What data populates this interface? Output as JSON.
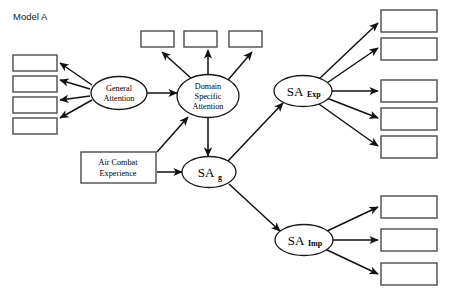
{
  "diagram": {
    "title": "Model A",
    "nodes": {
      "general_attention": {
        "label_line1": "General",
        "label_line2": "Attention"
      },
      "domain_specific_attention": {
        "label_line1": "Domain",
        "label_line2": "Specific",
        "label_line3": "Attention"
      },
      "air_combat_experience": {
        "label_line1": "Air Combat",
        "label_line2": "Experience"
      },
      "sa_g": {
        "base": "SA",
        "subscript": "g"
      },
      "sa_exp": {
        "base": "SA",
        "subscript": "Exp"
      },
      "sa_imp": {
        "base": "SA",
        "subscript": "Imp"
      }
    },
    "indicator_boxes": {
      "left": [
        {
          "id": "left-indicator-1",
          "label": ""
        },
        {
          "id": "left-indicator-2",
          "label": ""
        },
        {
          "id": "left-indicator-3",
          "label": ""
        },
        {
          "id": "left-indicator-4",
          "label": ""
        }
      ],
      "top": [
        {
          "id": "top-indicator-1",
          "label": ""
        },
        {
          "id": "top-indicator-2",
          "label": ""
        },
        {
          "id": "top-indicator-3",
          "label": ""
        }
      ],
      "right_upper": [
        {
          "id": "right-upper-indicator-1",
          "label": ""
        },
        {
          "id": "right-upper-indicator-2",
          "label": ""
        },
        {
          "id": "right-upper-indicator-3",
          "label": ""
        },
        {
          "id": "right-upper-indicator-4",
          "label": ""
        },
        {
          "id": "right-upper-indicator-5",
          "label": ""
        }
      ],
      "right_lower": [
        {
          "id": "right-lower-indicator-1",
          "label": ""
        },
        {
          "id": "right-lower-indicator-2",
          "label": ""
        },
        {
          "id": "right-lower-indicator-3",
          "label": ""
        }
      ]
    },
    "colors": {
      "background": "#ffffff",
      "box_stroke": "#4a4a4a",
      "ellipse_stroke": "#1a1a1a",
      "edge_stroke": "#111111",
      "text": "#000000"
    }
  }
}
